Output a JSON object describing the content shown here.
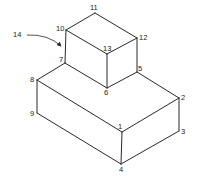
{
  "diagram": {
    "type": "isometric-block-figure",
    "vertices": [
      {
        "id": "1",
        "x": 122,
        "y": 132,
        "label_x": 118,
        "label_y": 129
      },
      {
        "id": "2",
        "x": 179,
        "y": 98,
        "label_x": 181,
        "label_y": 100
      },
      {
        "id": "3",
        "x": 179,
        "y": 131,
        "label_x": 181,
        "label_y": 134
      },
      {
        "id": "4",
        "x": 121,
        "y": 164,
        "label_x": 119,
        "label_y": 172
      },
      {
        "id": "5",
        "x": 137,
        "y": 72,
        "label_x": 138,
        "label_y": 71
      },
      {
        "id": "6",
        "x": 107,
        "y": 88,
        "label_x": 104,
        "label_y": 95
      },
      {
        "id": "7",
        "x": 65,
        "y": 63,
        "label_x": 59,
        "label_y": 62
      },
      {
        "id": "8",
        "x": 37,
        "y": 80,
        "label_x": 30,
        "label_y": 82
      },
      {
        "id": "9",
        "x": 37,
        "y": 113,
        "label_x": 30,
        "label_y": 116
      },
      {
        "id": "10",
        "x": 66,
        "y": 30,
        "label_x": 56,
        "label_y": 31
      },
      {
        "id": "11",
        "x": 95,
        "y": 13,
        "label_x": 90,
        "label_y": 10
      },
      {
        "id": "12",
        "x": 137,
        "y": 38,
        "label_x": 139,
        "label_y": 40
      },
      {
        "id": "13",
        "x": 107,
        "y": 54,
        "label_x": 103,
        "label_y": 51
      }
    ],
    "edges": [
      [
        "8",
        "1"
      ],
      [
        "1",
        "2"
      ],
      [
        "2",
        "5"
      ],
      [
        "1",
        "4"
      ],
      [
        "2",
        "3"
      ],
      [
        "3",
        "4"
      ],
      [
        "4",
        "9"
      ],
      [
        "9",
        "8"
      ],
      [
        "8",
        "7"
      ],
      [
        "7",
        "6"
      ],
      [
        "6",
        "5"
      ],
      [
        "10",
        "11"
      ],
      [
        "11",
        "12"
      ],
      [
        "12",
        "13"
      ],
      [
        "13",
        "10"
      ],
      [
        "10",
        "7"
      ],
      [
        "13",
        "6"
      ],
      [
        "12",
        "5"
      ]
    ],
    "callout": {
      "label": "14",
      "label_x": 13,
      "label_y": 37,
      "arrow_path": "M 27 35 Q 48 34 61 46"
    }
  }
}
